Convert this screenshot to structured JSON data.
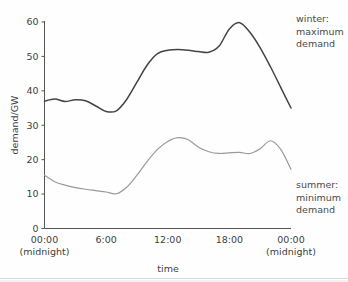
{
  "chart_data": {
    "type": "line",
    "title": "",
    "xlabel": "time",
    "ylabel": "demand/GW",
    "xlim": [
      0,
      24
    ],
    "ylim": [
      0,
      60
    ],
    "grid": false,
    "legend_position": "inline-annotations-right",
    "x_tick_labels": [
      "00:00",
      "6:00",
      "12:00",
      "18:00",
      "00:00"
    ],
    "x_tick_sublabels": [
      "(midnight)",
      "",
      "",
      "",
      "(midnight)"
    ],
    "x_tick_values": [
      0,
      6,
      12,
      18,
      24
    ],
    "y_tick_labels": [
      "0",
      "10",
      "20",
      "30",
      "40",
      "50",
      "60"
    ],
    "y_tick_values": [
      0,
      10,
      20,
      30,
      40,
      50,
      60
    ],
    "x": [
      0,
      1,
      2,
      3,
      4,
      5,
      6,
      7,
      8,
      9,
      10,
      11,
      12,
      13,
      14,
      15,
      16,
      17,
      18,
      19,
      20,
      21,
      22,
      23,
      24
    ],
    "series": [
      {
        "name": "winter: maximum demand",
        "color": "#444444",
        "values": [
          37.0,
          37.6,
          36.9,
          37.4,
          37.1,
          35.6,
          34.0,
          34.2,
          37.5,
          42.5,
          47.5,
          50.8,
          51.8,
          52.0,
          51.8,
          51.4,
          51.2,
          53.0,
          58.0,
          59.8,
          57.0,
          52.5,
          47.0,
          41.0,
          35.0
        ]
      },
      {
        "name": "summer: minimum demand",
        "color": "#9a9a9a",
        "values": [
          15.5,
          13.6,
          12.6,
          11.9,
          11.4,
          11.0,
          10.6,
          10.1,
          12.0,
          15.5,
          19.5,
          23.0,
          25.3,
          26.4,
          25.8,
          23.6,
          22.3,
          21.8,
          22.0,
          22.1,
          21.8,
          23.2,
          25.5,
          23.0,
          17.2
        ]
      }
    ],
    "annotations": [
      {
        "name": "winter-annotation",
        "lines": [
          "winter:",
          "maximum",
          "demand"
        ],
        "x": 296,
        "y": 22
      },
      {
        "name": "summer-annotation",
        "lines": [
          "summer:",
          "minimum",
          "demand"
        ],
        "x": 296,
        "y": 188
      }
    ]
  }
}
